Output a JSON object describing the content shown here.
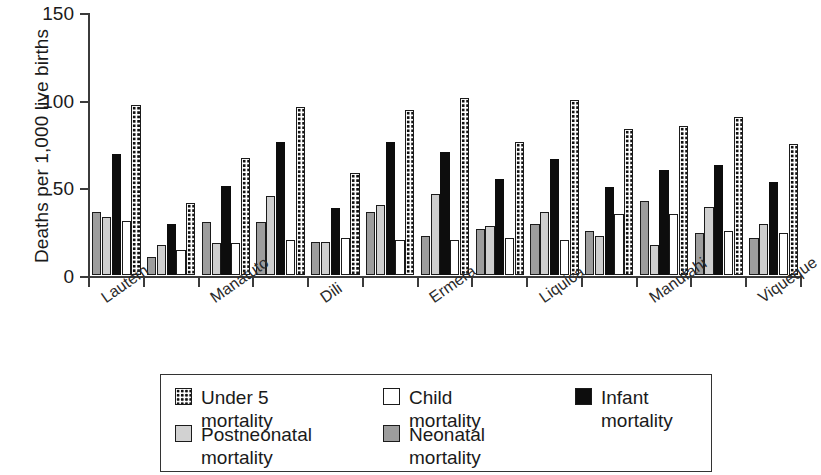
{
  "chart_data": {
    "type": "bar",
    "title": "",
    "xlabel": "",
    "ylabel": "Deaths per 1,000 live births",
    "ylim": [
      0,
      150
    ],
    "yticks": [
      0,
      50,
      100,
      150
    ],
    "ytick_labels": [
      "0",
      "50",
      "100",
      "150"
    ],
    "grid": false,
    "legend_position": "bottom",
    "categories": [
      "Lautem",
      "",
      "Manatuto",
      "",
      "Dili",
      "",
      "Ermera",
      "",
      "Liquica",
      "",
      "Manufahi",
      "",
      "Viqueque"
    ],
    "visible_tick_labels": [
      "Lautem",
      "Manatuto",
      "Dili",
      "Ermera",
      "Liquica",
      "Manufahi",
      "Viqueque"
    ],
    "series": [
      {
        "name": "Neonatal mortality",
        "color": "#9d9d9d",
        "pattern": "solid-medium-gray",
        "values": [
          36,
          10,
          30,
          30,
          19,
          36,
          22,
          26,
          29,
          25,
          42,
          24,
          21
        ]
      },
      {
        "name": "Postneonatal mortality",
        "color": "#cfcfcf",
        "pattern": "solid-light-gray",
        "values": [
          33,
          17,
          18,
          45,
          19,
          40,
          46,
          28,
          36,
          22,
          17,
          39,
          29
        ]
      },
      {
        "name": "Infant mortality",
        "color": "#0d0d0d",
        "pattern": "solid-black",
        "values": [
          69,
          29,
          51,
          76,
          38,
          76,
          70,
          55,
          66,
          50,
          60,
          63,
          53
        ]
      },
      {
        "name": "Child mortality",
        "color": "#ffffff",
        "pattern": "open-white",
        "values": [
          31,
          14,
          18,
          20,
          21,
          20,
          20,
          21,
          20,
          35,
          35,
          25,
          24
        ]
      },
      {
        "name": "Under 5 mortality",
        "color": "#ffffff",
        "pattern": "checkered-dotted",
        "values": [
          97,
          41,
          67,
          96,
          58,
          94,
          101,
          76,
          100,
          83,
          85,
          90,
          75
        ]
      }
    ]
  },
  "legend": {
    "items": [
      {
        "label": "Under 5 mortality",
        "swatch": "under5"
      },
      {
        "label": "Child mortality",
        "swatch": "child"
      },
      {
        "label": "Infant mortality",
        "swatch": "infant"
      },
      {
        "label": "Postneonatal mortality",
        "swatch": "postneonatal"
      },
      {
        "label": "Neonatal mortality",
        "swatch": "neonatal"
      }
    ]
  }
}
